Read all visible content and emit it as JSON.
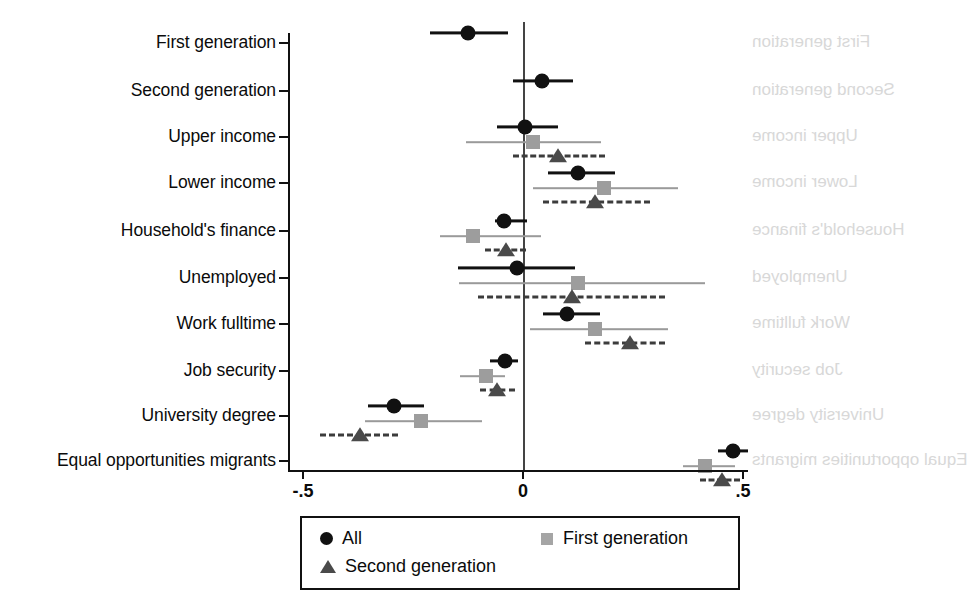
{
  "chart_data": {
    "type": "scatter",
    "subtype": "coefficient-forest-plot",
    "title": "",
    "xlabel": "",
    "ylabel": "",
    "xlim": [
      -0.5,
      0.5
    ],
    "xticks": [
      -0.5,
      0,
      0.5
    ],
    "xtick_labels": [
      "-.5",
      "0",
      ".5"
    ],
    "grid": false,
    "zero_reference_line": 0,
    "legend_position": "bottom",
    "categories": [
      "First generation",
      "Second generation",
      "Upper income",
      "Lower income",
      "Household's finance",
      "Unemployed",
      "Work fulltime",
      "Job security",
      "University degree",
      "Equal opportunities migrants"
    ],
    "series": [
      {
        "name": "All",
        "marker": "circle",
        "color": "#111111",
        "line_style": "solid",
        "estimates": [
          -0.125,
          0.043,
          0.005,
          0.125,
          -0.043,
          -0.014,
          0.1,
          -0.041,
          -0.293,
          0.477
        ],
        "ci_low": [
          -0.211,
          -0.023,
          -0.059,
          0.057,
          -0.064,
          -0.148,
          0.045,
          -0.075,
          -0.352,
          0.443
        ],
        "ci_high": [
          -0.034,
          0.114,
          0.08,
          0.209,
          0.009,
          0.118,
          0.175,
          -0.011,
          -0.225,
          0.511
        ]
      },
      {
        "name": "First generation",
        "marker": "square",
        "color": "#9d9d9d",
        "line_style": "solid",
        "estimates": [
          null,
          null,
          0.023,
          0.184,
          -0.114,
          0.125,
          0.164,
          -0.084,
          -0.232,
          0.414
        ],
        "ci_low": [
          null,
          null,
          -0.13,
          0.023,
          -0.189,
          -0.145,
          0.016,
          -0.143,
          -0.359,
          0.364
        ],
        "ci_high": [
          null,
          null,
          0.177,
          0.352,
          0.041,
          0.414,
          0.33,
          -0.041,
          -0.093,
          0.482
        ]
      },
      {
        "name": "Second generation",
        "marker": "triangle",
        "color": "#4a4a4a",
        "line_style": "dashed",
        "estimates": [
          null,
          null,
          0.08,
          0.164,
          -0.039,
          0.111,
          0.243,
          -0.059,
          -0.371,
          0.452
        ],
        "ci_low": [
          null,
          null,
          -0.023,
          0.045,
          -0.086,
          -0.102,
          0.141,
          -0.098,
          -0.461,
          0.402
        ],
        "ci_high": [
          null,
          null,
          0.186,
          0.289,
          0.007,
          0.323,
          0.323,
          -0.018,
          -0.284,
          0.493
        ]
      }
    ]
  },
  "axis": {
    "xtick_labels": [
      "-.5",
      "0",
      ".5"
    ],
    "category_labels": [
      "First generation",
      "Second generation",
      "Upper income",
      "Lower income",
      "Household's finance",
      "Unemployed",
      "Work fulltime",
      "Job security",
      "University degree",
      "Equal opportunities migrants"
    ]
  },
  "legend": {
    "entries": [
      {
        "label": "All",
        "marker": "circle-marker-icon"
      },
      {
        "label": "First generation",
        "marker": "square-marker-icon"
      },
      {
        "label": "Second generation",
        "marker": "triangle-marker-icon"
      }
    ]
  },
  "colors": {
    "all": "#111111",
    "first_generation": "#9d9d9d",
    "second_generation": "#4a4a4a",
    "axis": "#111111",
    "background": "#ffffff"
  }
}
